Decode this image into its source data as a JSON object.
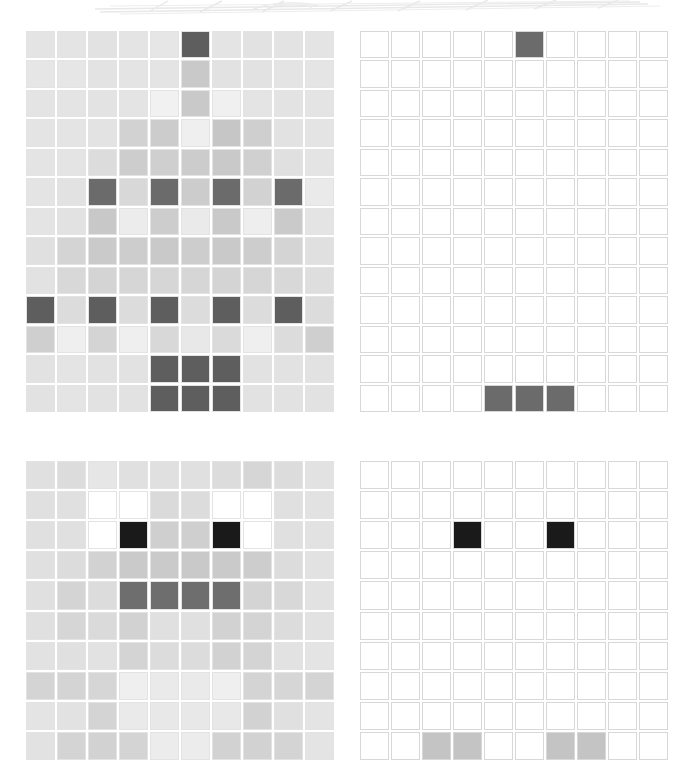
{
  "figure": {
    "title": "",
    "panel_count": 4,
    "background_color": "#ffffff"
  },
  "banner": {
    "name": "faint-decorative-strip",
    "description": "very light gray partial graphic clipped at top edge",
    "stroke_color": "#e8e8e8"
  },
  "palette": {
    "white": "#ffffff",
    "near_white": "#f5f5f5",
    "light_gray": "#e0e0e0",
    "pale_gray": "#eaeaea",
    "mid_gray": "#c9c9c9",
    "gray": "#bdbdbd",
    "dark_gray": "#6e6e6e",
    "darker_gray": "#5e5e5e",
    "black": "#1a1a1a",
    "gridline": "#d8d8d8"
  },
  "chart_data": {
    "type": "heatmap",
    "title": "",
    "xlabel": "",
    "ylabel": "",
    "grid": true,
    "legend": "none",
    "panels": [
      {
        "name": "top-left",
        "label": "dense-gray-heatmap",
        "rows": 13,
        "cols": 10,
        "cell_size": 30,
        "values": [
          [
            "#e4e4e4",
            "#e4e4e4",
            "#e2e2e2",
            "#e4e4e4",
            "#e6e6e6",
            "#5e5e5e",
            "#e4e4e4",
            "#e2e2e2",
            "#e3e3e3",
            "#e4e4e4"
          ],
          [
            "#e6e6e6",
            "#e6e6e6",
            "#e3e3e3",
            "#e4e4e4",
            "#e4e4e4",
            "#c9c9c9",
            "#e2e2e2",
            "#e2e2e2",
            "#e4e4e4",
            "#e5e5e5"
          ],
          [
            "#e4e4e4",
            "#e4e4e4",
            "#e3e3e3",
            "#e4e4e4",
            "#f1f1f1",
            "#c9c9c9",
            "#f0f0f0",
            "#e4e4e4",
            "#e3e3e3",
            "#e4e4e4"
          ],
          [
            "#e4e4e4",
            "#e4e4e4",
            "#e3e3e3",
            "#d2d2d2",
            "#cccccc",
            "#efefef",
            "#c6c6c6",
            "#cfcfcf",
            "#e2e2e2",
            "#e4e4e4"
          ],
          [
            "#e4e4e4",
            "#e4e4e4",
            "#dcdcdc",
            "#cdcdcd",
            "#cfcfcf",
            "#cccccc",
            "#c9c9c9",
            "#d0d0d0",
            "#e0e0e0",
            "#e4e4e4"
          ],
          [
            "#e4e4e4",
            "#e2e2e2",
            "#6b6b6b",
            "#d8d8d8",
            "#6b6b6b",
            "#cccccc",
            "#6b6b6b",
            "#d2d2d2",
            "#6b6b6b",
            "#eaeaea"
          ],
          [
            "#e4e4e4",
            "#e2e2e2",
            "#c8c8c8",
            "#ececec",
            "#cdcdcd",
            "#eaeaea",
            "#c9c9c9",
            "#eeeeee",
            "#cacaca",
            "#e4e4e4"
          ],
          [
            "#e0e0e0",
            "#d4d4d4",
            "#cacaca",
            "#cdcdcd",
            "#c9c9c9",
            "#cdcdcd",
            "#c9c9c9",
            "#cdcdcd",
            "#d4d4d4",
            "#e0e0e0"
          ],
          [
            "#e2e2e2",
            "#d8d8d8",
            "#d4d4d4",
            "#d6d6d6",
            "#d6d6d6",
            "#d6d6d6",
            "#d4d4d4",
            "#d6d6d6",
            "#d8d8d8",
            "#dedede"
          ],
          [
            "#5e5e5e",
            "#dcdcdc",
            "#5e5e5e",
            "#dcdcdc",
            "#5e5e5e",
            "#dcdcdc",
            "#5e5e5e",
            "#dcdcdc",
            "#5e5e5e",
            "#dcdcdc"
          ],
          [
            "#cfcfcf",
            "#efefef",
            "#d4d4d4",
            "#efefef",
            "#d8d8d8",
            "#e8e8e8",
            "#dadada",
            "#efefef",
            "#dcdcdc",
            "#cfcfcf"
          ],
          [
            "#e2e2e2",
            "#e4e4e4",
            "#e2e2e2",
            "#e2e2e2",
            "#5e5e5e",
            "#5e5e5e",
            "#5e5e5e",
            "#e2e2e2",
            "#e2e2e2",
            "#e2e2e2"
          ],
          [
            "#e2e2e2",
            "#e4e4e4",
            "#e2e2e2",
            "#e2e2e2",
            "#5e5e5e",
            "#5e5e5e",
            "#5e5e5e",
            "#e2e2e2",
            "#e2e2e2",
            "#e2e2e2"
          ]
        ]
      },
      {
        "name": "top-right",
        "label": "sparse-threshold-heatmap",
        "rows": 13,
        "cols": 10,
        "cell_size": 30,
        "values": [
          [
            "#ffffff",
            "#ffffff",
            "#ffffff",
            "#ffffff",
            "#ffffff",
            "#6b6b6b",
            "#ffffff",
            "#ffffff",
            "#ffffff",
            "#ffffff"
          ],
          [
            "#ffffff",
            "#ffffff",
            "#ffffff",
            "#ffffff",
            "#ffffff",
            "#ffffff",
            "#ffffff",
            "#ffffff",
            "#ffffff",
            "#ffffff"
          ],
          [
            "#ffffff",
            "#ffffff",
            "#ffffff",
            "#ffffff",
            "#ffffff",
            "#ffffff",
            "#ffffff",
            "#ffffff",
            "#ffffff",
            "#ffffff"
          ],
          [
            "#ffffff",
            "#ffffff",
            "#ffffff",
            "#ffffff",
            "#ffffff",
            "#ffffff",
            "#ffffff",
            "#ffffff",
            "#ffffff",
            "#ffffff"
          ],
          [
            "#ffffff",
            "#ffffff",
            "#ffffff",
            "#ffffff",
            "#ffffff",
            "#ffffff",
            "#ffffff",
            "#ffffff",
            "#ffffff",
            "#ffffff"
          ],
          [
            "#ffffff",
            "#ffffff",
            "#ffffff",
            "#ffffff",
            "#ffffff",
            "#ffffff",
            "#ffffff",
            "#ffffff",
            "#ffffff",
            "#ffffff"
          ],
          [
            "#ffffff",
            "#ffffff",
            "#ffffff",
            "#ffffff",
            "#ffffff",
            "#ffffff",
            "#ffffff",
            "#ffffff",
            "#ffffff",
            "#ffffff"
          ],
          [
            "#ffffff",
            "#ffffff",
            "#ffffff",
            "#ffffff",
            "#ffffff",
            "#ffffff",
            "#ffffff",
            "#ffffff",
            "#ffffff",
            "#ffffff"
          ],
          [
            "#ffffff",
            "#ffffff",
            "#ffffff",
            "#ffffff",
            "#ffffff",
            "#ffffff",
            "#ffffff",
            "#ffffff",
            "#ffffff",
            "#ffffff"
          ],
          [
            "#ffffff",
            "#ffffff",
            "#ffffff",
            "#ffffff",
            "#ffffff",
            "#ffffff",
            "#ffffff",
            "#ffffff",
            "#ffffff",
            "#ffffff"
          ],
          [
            "#ffffff",
            "#ffffff",
            "#ffffff",
            "#ffffff",
            "#ffffff",
            "#ffffff",
            "#ffffff",
            "#ffffff",
            "#ffffff",
            "#ffffff"
          ],
          [
            "#ffffff",
            "#ffffff",
            "#ffffff",
            "#ffffff",
            "#ffffff",
            "#ffffff",
            "#ffffff",
            "#ffffff",
            "#ffffff",
            "#ffffff"
          ],
          [
            "#ffffff",
            "#ffffff",
            "#ffffff",
            "#ffffff",
            "#6b6b6b",
            "#6b6b6b",
            "#6b6b6b",
            "#ffffff",
            "#ffffff",
            "#ffffff"
          ]
        ]
      },
      {
        "name": "bottom-left",
        "label": "face-gray-heatmap",
        "rows": 10,
        "cols": 10,
        "cell_size": 30,
        "values": [
          [
            "#e0e0e0",
            "#dcdcdc",
            "#e6e6e6",
            "#e0e0e0",
            "#e0e0e0",
            "#e0e0e0",
            "#dcdcdc",
            "#d6d6d6",
            "#dcdcdc",
            "#e2e2e2"
          ],
          [
            "#e0e0e0",
            "#e0e0e0",
            "#ffffff",
            "#ffffff",
            "#dadada",
            "#dcdcdc",
            "#ffffff",
            "#ffffff",
            "#e0e0e0",
            "#e2e2e2"
          ],
          [
            "#e0e0e0",
            "#e0e0e0",
            "#ffffff",
            "#1a1a1a",
            "#cfcfcf",
            "#cfcfcf",
            "#1a1a1a",
            "#ffffff",
            "#e0e0e0",
            "#e2e2e2"
          ],
          [
            "#e0e0e0",
            "#dcdcdc",
            "#d2d2d2",
            "#cacaca",
            "#cacaca",
            "#c9c9c9",
            "#cacaca",
            "#cdcdcd",
            "#dcdcdc",
            "#e2e2e2"
          ],
          [
            "#e0e0e0",
            "#d4d4d4",
            "#dcdcdc",
            "#6e6e6e",
            "#6e6e6e",
            "#6e6e6e",
            "#6e6e6e",
            "#d4d4d4",
            "#d8d8d8",
            "#e2e2e2"
          ],
          [
            "#e0e0e0",
            "#d6d6d6",
            "#dadada",
            "#d2d2d2",
            "#e0e0e0",
            "#e0e0e0",
            "#d2d2d2",
            "#d4d4d4",
            "#dcdcdc",
            "#e2e2e2"
          ],
          [
            "#e2e2e2",
            "#e0e0e0",
            "#e2e2e2",
            "#d4d4d4",
            "#dcdcdc",
            "#dcdcdc",
            "#d2d2d2",
            "#d4d4d4",
            "#e2e2e2",
            "#e4e4e4"
          ],
          [
            "#d4d4d4",
            "#d4d4d4",
            "#d6d6d6",
            "#efefef",
            "#eaeaea",
            "#eaeaea",
            "#efefef",
            "#d4d4d4",
            "#d6d6d6",
            "#d4d4d4"
          ],
          [
            "#e4e4e4",
            "#e2e2e2",
            "#d4d4d4",
            "#eaeaea",
            "#e8e8e8",
            "#e8e8e8",
            "#e8e8e8",
            "#d2d2d2",
            "#e0e0e0",
            "#e4e4e4"
          ],
          [
            "#e2e2e2",
            "#d4d4d4",
            "#d2d2d2",
            "#d4d4d4",
            "#ececec",
            "#ececec",
            "#d2d2d2",
            "#d2d2d2",
            "#d4d4d4",
            "#e4e4e4"
          ]
        ]
      },
      {
        "name": "bottom-right",
        "label": "face-threshold-heatmap",
        "rows": 10,
        "cols": 10,
        "cell_size": 30,
        "values": [
          [
            "#ffffff",
            "#ffffff",
            "#ffffff",
            "#ffffff",
            "#ffffff",
            "#ffffff",
            "#ffffff",
            "#ffffff",
            "#ffffff",
            "#ffffff"
          ],
          [
            "#ffffff",
            "#ffffff",
            "#ffffff",
            "#ffffff",
            "#ffffff",
            "#ffffff",
            "#ffffff",
            "#ffffff",
            "#ffffff",
            "#ffffff"
          ],
          [
            "#ffffff",
            "#ffffff",
            "#ffffff",
            "#1a1a1a",
            "#ffffff",
            "#ffffff",
            "#1a1a1a",
            "#ffffff",
            "#ffffff",
            "#ffffff"
          ],
          [
            "#ffffff",
            "#ffffff",
            "#ffffff",
            "#ffffff",
            "#ffffff",
            "#ffffff",
            "#ffffff",
            "#ffffff",
            "#ffffff",
            "#ffffff"
          ],
          [
            "#ffffff",
            "#ffffff",
            "#ffffff",
            "#ffffff",
            "#ffffff",
            "#ffffff",
            "#ffffff",
            "#ffffff",
            "#ffffff",
            "#ffffff"
          ],
          [
            "#ffffff",
            "#ffffff",
            "#ffffff",
            "#ffffff",
            "#ffffff",
            "#ffffff",
            "#ffffff",
            "#ffffff",
            "#ffffff",
            "#ffffff"
          ],
          [
            "#ffffff",
            "#ffffff",
            "#ffffff",
            "#ffffff",
            "#ffffff",
            "#ffffff",
            "#ffffff",
            "#ffffff",
            "#ffffff",
            "#ffffff"
          ],
          [
            "#ffffff",
            "#ffffff",
            "#ffffff",
            "#ffffff",
            "#ffffff",
            "#ffffff",
            "#ffffff",
            "#ffffff",
            "#ffffff",
            "#ffffff"
          ],
          [
            "#ffffff",
            "#ffffff",
            "#ffffff",
            "#ffffff",
            "#ffffff",
            "#ffffff",
            "#ffffff",
            "#ffffff",
            "#ffffff",
            "#ffffff"
          ],
          [
            "#ffffff",
            "#ffffff",
            "#c4c4c4",
            "#c4c4c4",
            "#ffffff",
            "#ffffff",
            "#c4c4c4",
            "#c4c4c4",
            "#ffffff",
            "#ffffff"
          ]
        ]
      }
    ]
  }
}
